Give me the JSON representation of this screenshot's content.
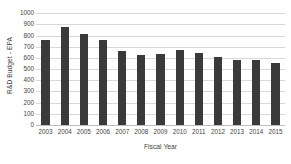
{
  "chart_data": {
    "type": "bar",
    "title": "",
    "subtitle": "",
    "xlabel": "Fiscal Year",
    "ylabel": "R&D Budget - EPA",
    "categories": [
      "2003",
      "2004",
      "2005",
      "2006",
      "2007",
      "2008",
      "2009",
      "2010",
      "2011",
      "2012",
      "2013",
      "2014",
      "2015"
    ],
    "values": [
      760,
      875,
      818,
      765,
      660,
      628,
      640,
      675,
      645,
      612,
      582,
      582,
      555
    ],
    "series": [
      {
        "name": "R&D Budget - EPA",
        "values": [
          760,
          875,
          818,
          765,
          660,
          628,
          640,
          675,
          645,
          612,
          582,
          582,
          555
        ]
      }
    ],
    "ylim": [
      0,
      1000
    ],
    "y_ticks": [
      0,
      100,
      200,
      300,
      400,
      500,
      600,
      700,
      800,
      900,
      1000
    ],
    "y_tick_labels": [
      "0",
      "100",
      "200",
      "300",
      "400",
      "500",
      "600",
      "700",
      "800",
      "900",
      "1000"
    ],
    "grid": true,
    "grid_axis": "y",
    "legend": false,
    "legend_position": "none",
    "bar_color": "#3a3a3a",
    "gridline_color": "#d9d9d9",
    "background_color": "#ffffff",
    "text_color": "#3f3f3f"
  },
  "axes": {
    "x_title": "Fiscal Year",
    "y_title": "R&D Budget - EPA"
  }
}
